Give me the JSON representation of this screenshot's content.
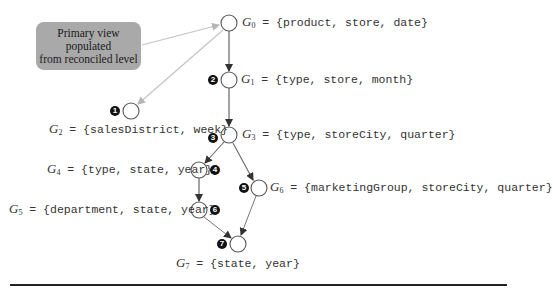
{
  "callout": {
    "line1": "Primary view populated",
    "line2": "from reconciled level"
  },
  "nodes": [
    {
      "id": "G0",
      "name": "G",
      "sub": "0",
      "eq": " = {product, store, date}",
      "step": ""
    },
    {
      "id": "G1",
      "name": "G",
      "sub": "1",
      "eq": " = {type, store, month}",
      "step": "2"
    },
    {
      "id": "G2",
      "name": "G",
      "sub": "2",
      "eq": " = {salesDistrict, week}",
      "step": "1"
    },
    {
      "id": "G3",
      "name": "G",
      "sub": "3",
      "eq": " = {type, storeCity, quarter}",
      "step": "3"
    },
    {
      "id": "G4",
      "name": "G",
      "sub": "4",
      "eq": " = {type, state, year}",
      "step": "4"
    },
    {
      "id": "G5",
      "name": "G",
      "sub": "5",
      "eq": " = {department, state, year}",
      "step": "6"
    },
    {
      "id": "G6",
      "name": "G",
      "sub": "6",
      "eq": " = {marketingGroup, storeCity, quarter}",
      "step": "5"
    },
    {
      "id": "G7",
      "name": "G",
      "sub": "7",
      "eq": " = {state, year}",
      "step": "7"
    }
  ],
  "edges": [
    {
      "from": "callout",
      "to": "G0",
      "style": "light"
    },
    {
      "from": "G0",
      "to": "G2",
      "style": "light"
    },
    {
      "from": "G0",
      "to": "G1",
      "style": "dark"
    },
    {
      "from": "G1",
      "to": "G3",
      "style": "dark"
    },
    {
      "from": "G3",
      "to": "G4",
      "style": "dark"
    },
    {
      "from": "G3",
      "to": "G6",
      "style": "dark"
    },
    {
      "from": "G4",
      "to": "G5",
      "style": "dark"
    },
    {
      "from": "G5",
      "to": "G7",
      "style": "dark"
    },
    {
      "from": "G6",
      "to": "G7",
      "style": "dark"
    }
  ],
  "colors": {
    "callout_fill": "#a9a9a9",
    "light_edge": "#bdbdbd",
    "dark_edge": "#555555",
    "badge": "#111111"
  }
}
